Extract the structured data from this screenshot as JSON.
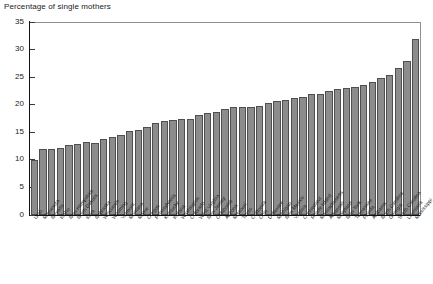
{
  "chart_data": {
    "type": "bar",
    "title": "Percentage of single mothers",
    "xlabel": "",
    "ylabel": "",
    "ylim": [
      0,
      35
    ],
    "yticks": [
      0,
      5,
      10,
      15,
      20,
      25,
      30,
      35
    ],
    "grid": false,
    "legend": null,
    "bar_color": "#8c8c8c",
    "bar_edge_color": "#4f4f4f",
    "categories": [
      "Utah",
      "Minnesota",
      "Nevada",
      "Idaho",
      "New Hampshire",
      "North Dakota",
      "Iowa",
      "Nebraska",
      "Wisconsin",
      "Wyoming",
      "Vermont",
      "Montana",
      "Maine",
      "Oregon",
      "Pennsylvania",
      "Kentucky",
      "Indiana",
      "Washington",
      "Colorado",
      "West Virginia",
      "New Jersey",
      "Oklahoma",
      "Arizona",
      "Missouri",
      "Texas",
      "California",
      "Ohio",
      "Delaware",
      "Michigan",
      "New Mexico",
      "Virginia",
      "Connecticut",
      "Rhode Island",
      "Massachusetts",
      "Arkansas",
      "Maryland",
      "New York",
      "Tennessee",
      "Florida",
      "Alabama",
      "North Carolina",
      "Georgia",
      "South Carolina",
      "Louisiana",
      "Mississippi"
    ],
    "values": [
      10.0,
      12.0,
      12.0,
      12.2,
      12.7,
      12.8,
      13.2,
      13.0,
      13.7,
      14.1,
      14.6,
      15.3,
      15.5,
      16.0,
      16.6,
      17.0,
      17.2,
      17.4,
      17.5,
      18.1,
      18.5,
      18.7,
      19.2,
      19.5,
      19.6,
      19.6,
      19.7,
      20.3,
      20.6,
      20.9,
      21.2,
      21.4,
      21.9,
      22.0,
      22.4,
      22.9,
      23.0,
      23.3,
      23.6,
      24.2,
      24.8,
      25.4,
      26.6,
      28.0,
      32.0
    ]
  }
}
